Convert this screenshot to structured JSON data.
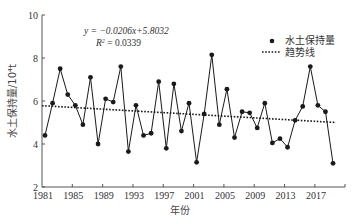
{
  "chart_data": {
    "type": "line",
    "title": "",
    "xlabel": "年份",
    "ylabel": "水土保持量/10⁴t",
    "xlim": [
      1981,
      2020
    ],
    "ylim": [
      2,
      10
    ],
    "x_ticks": [
      1981,
      1985,
      1989,
      1993,
      1997,
      2001,
      2005,
      2009,
      2013,
      2017
    ],
    "y_ticks": [
      2,
      4,
      6,
      8,
      10
    ],
    "grid": false,
    "legend_position": "upper right",
    "x": [
      1981,
      1982,
      1983,
      1984,
      1985,
      1986,
      1987,
      1988,
      1989,
      1990,
      1991,
      1992,
      1993,
      1994,
      1995,
      1996,
      1997,
      1998,
      1999,
      2000,
      2001,
      2002,
      2003,
      2004,
      2005,
      2006,
      2007,
      2008,
      2009,
      2010,
      2011,
      2012,
      2013,
      2014,
      2015,
      2016,
      2017,
      2018,
      2019
    ],
    "series": [
      {
        "name": "水土保持量",
        "style": "line-with-markers",
        "values": [
          4.4,
          5.9,
          7.5,
          6.3,
          5.8,
          4.9,
          7.1,
          4.0,
          6.1,
          5.95,
          7.6,
          3.65,
          5.8,
          4.4,
          4.5,
          6.9,
          3.8,
          6.8,
          4.6,
          5.9,
          3.15,
          5.4,
          8.15,
          4.9,
          6.55,
          4.3,
          5.5,
          5.45,
          4.75,
          5.9,
          4.05,
          4.25,
          3.85,
          5.1,
          5.75,
          7.6,
          5.8,
          5.5,
          3.1
        ]
      },
      {
        "name": "趋势线",
        "style": "dotted",
        "slope": -0.0206,
        "intercept": 5.8032
      }
    ],
    "annotations": {
      "equation": "y = −0.0206x+5.8032",
      "r2": "R² = 0.0339"
    }
  },
  "labels": {
    "equation": "y = −0.0206x+5.8032",
    "r2_prefix": "R",
    "r2_value": " = 0.0339",
    "legend_series": "水土保持量",
    "legend_trend": "趋势线",
    "xlabel": "年份",
    "ylabel": "水土保持量/10⁴t"
  },
  "colors": {
    "line": "#1a1a1a",
    "axis": "#555555",
    "trend": "#1a1a1a"
  }
}
